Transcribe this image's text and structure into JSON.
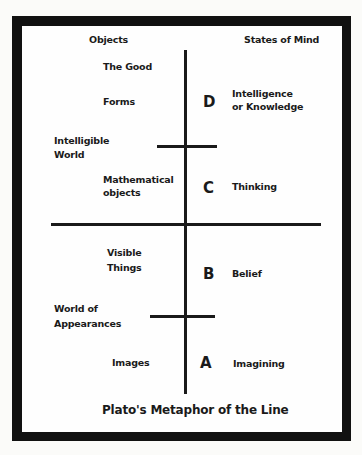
{
  "diagram": {
    "title": "Plato's Metaphor of the Line",
    "headers": {
      "left": "Objects",
      "right": "States of Mind"
    },
    "regions": {
      "upper": "Intelligible\nWorld",
      "upper_line1": "Intelligible",
      "upper_line2": "World",
      "lower_line1": "World of",
      "lower_line2": "Appearances"
    },
    "segments": [
      {
        "letter": "D",
        "objects_line1": "The Good",
        "objects_line2": "Forms",
        "state_line1": "Intelligence",
        "state_line2": "or Knowledge"
      },
      {
        "letter": "C",
        "objects_line1": "Mathematical",
        "objects_line2": "objects",
        "state_line1": "Thinking"
      },
      {
        "letter": "B",
        "objects_line1": "Visible",
        "objects_line2": "Things",
        "state_line1": "Belief"
      },
      {
        "letter": "A",
        "objects_line1": "Images",
        "state_line1": "Imagining"
      }
    ],
    "colors": {
      "ink": "#1a1a1a",
      "frame": "#111111",
      "paper": "#fefefe"
    }
  }
}
